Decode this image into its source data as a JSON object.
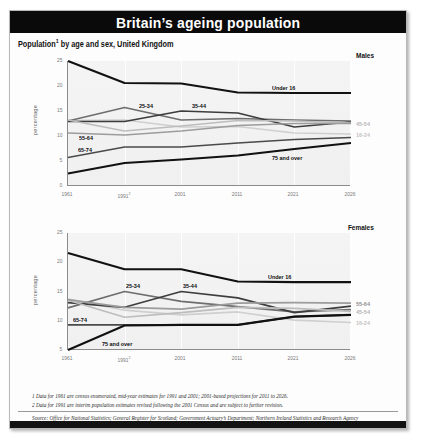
{
  "banner": {
    "title": "Britain’s ageing population"
  },
  "subtitle": {
    "text": "Population",
    "sup": "1",
    "rest": " by age and sex, United Kingdom"
  },
  "footnotes": [
    "1  Data for 1961 are census enumerated, mid-year estimates for 1991 and 2001; 2001-based projections for 2011 to 2026.",
    "2  Data for 1991 are interim population estimates revised following the 2001 Census and are subject to further revision."
  ],
  "source": "Source: Office for National Statistics; General Register for Scotland; Government Actuary’s Department; Northern Ireland Statistics and Research Agency",
  "colors": {
    "under16": "#111111",
    "over75": "#111111",
    "a65_74": "#4a4a4a",
    "a25_34": "#6e6e6e",
    "a35_44": "#3d3d3d",
    "a55_64": "#9c9c9c",
    "a45_54": "#bdbdbd",
    "a16_24": "#cfcfcf",
    "banner_bg": "#0a0a0a",
    "plot_bg": "#f2f2f2",
    "axis": "#8c8c8c"
  },
  "chart_data": [
    {
      "type": "line",
      "title": "Males",
      "xlabel": "",
      "ylabel": "percentage",
      "x": [
        "1961",
        "1991",
        "2001",
        "2011",
        "2021",
        "2026"
      ],
      "x_superscripts": [
        "",
        "2",
        "",
        "",
        "",
        ""
      ],
      "xlim": [
        1961,
        2026
      ],
      "ylim": [
        0,
        25
      ],
      "yticks": [
        0,
        5,
        10,
        15,
        20,
        25
      ],
      "grid": true,
      "legend": "inline-labels",
      "series": [
        {
          "name": "Under 16",
          "label": "Under 16",
          "label_pos": "inline",
          "color": "#111111",
          "width": 2.1,
          "values": [
            25.0,
            20.6,
            20.5,
            18.7,
            18.6,
            18.6
          ]
        },
        {
          "name": "16-24",
          "label": "16-24",
          "label_pos": "right",
          "color": "#cfcfcf",
          "width": 1.7,
          "values": [
            13.1,
            13.2,
            11.8,
            11.9,
            10.6,
            10.4
          ]
        },
        {
          "name": "25-34",
          "label": "25-34",
          "label_pos": "inline",
          "color": "#6e6e6e",
          "width": 1.7,
          "values": [
            13.0,
            15.7,
            13.2,
            13.5,
            13.2,
            13.0
          ]
        },
        {
          "name": "35-44",
          "label": "35-44",
          "label_pos": "inline",
          "color": "#3d3d3d",
          "width": 1.7,
          "values": [
            12.9,
            12.9,
            15.0,
            14.6,
            11.8,
            12.8
          ]
        },
        {
          "name": "45-54",
          "label": "45-54",
          "label_pos": "right",
          "color": "#bdbdbd",
          "width": 1.7,
          "values": [
            13.2,
            11.0,
            12.0,
            13.1,
            13.0,
            12.6
          ]
        },
        {
          "name": "55-64",
          "label": "55-64",
          "label_pos": "inline",
          "color": "#9c9c9c",
          "width": 1.7,
          "values": [
            10.6,
            10.2,
            11.0,
            12.1,
            12.5,
            12.5
          ]
        },
        {
          "name": "65-74",
          "label": "65-74",
          "label_pos": "inline",
          "color": "#4a4a4a",
          "width": 1.7,
          "values": [
            5.7,
            7.8,
            7.8,
            8.6,
            9.3,
            9.7
          ]
        },
        {
          "name": "75 and over",
          "label": "75 and over",
          "label_pos": "inline",
          "color": "#111111",
          "width": 2.1,
          "values": [
            2.5,
            4.6,
            5.3,
            6.1,
            7.4,
            8.6
          ]
        }
      ]
    },
    {
      "type": "line",
      "title": "Females",
      "xlabel": "",
      "ylabel": "percentage",
      "x": [
        "1961",
        "1991",
        "2001",
        "2011",
        "2021",
        "2026"
      ],
      "x_superscripts": [
        "",
        "2",
        "",
        "",
        "",
        ""
      ],
      "xlim": [
        1961,
        2026
      ],
      "ylim": [
        5,
        25
      ],
      "yticks": [
        5,
        10,
        15,
        20,
        25
      ],
      "grid": true,
      "legend": "inline-labels",
      "series": [
        {
          "name": "Under 16",
          "label": "Under 16",
          "label_pos": "inline",
          "color": "#111111",
          "width": 2.1,
          "values": [
            21.6,
            18.8,
            18.8,
            16.7,
            16.6,
            16.6
          ]
        },
        {
          "name": "16-24",
          "label": "16-24",
          "label_pos": "right",
          "color": "#cfcfcf",
          "width": 1.7,
          "values": [
            13.7,
            11.8,
            11.0,
            11.5,
            10.1,
            9.7
          ]
        },
        {
          "name": "25-34",
          "label": "25-34",
          "label_pos": "inline",
          "color": "#6e6e6e",
          "width": 1.7,
          "values": [
            12.2,
            15.0,
            13.3,
            12.4,
            11.5,
            11.9
          ]
        },
        {
          "name": "35-44",
          "label": "35-44",
          "label_pos": "inline",
          "color": "#3d3d3d",
          "width": 1.7,
          "values": [
            13.1,
            12.3,
            15.0,
            13.9,
            11.4,
            12.5
          ]
        },
        {
          "name": "45-54",
          "label": "45-54",
          "label_pos": "right",
          "color": "#bdbdbd",
          "width": 1.7,
          "values": [
            13.5,
            10.6,
            11.4,
            12.3,
            12.1,
            11.6
          ]
        },
        {
          "name": "55-64",
          "label": "55-64",
          "label_pos": "right",
          "color": "#9c9c9c",
          "width": 1.7,
          "values": [
            13.6,
            12.3,
            12.0,
            13.0,
            13.1,
            13.0
          ]
        },
        {
          "name": "65-74",
          "label": "65-74",
          "label_pos": "inline",
          "color": "#4a4a4a",
          "width": 1.7,
          "values": [
            9.3,
            9.3,
            9.3,
            9.3,
            10.7,
            11.0
          ]
        },
        {
          "name": "75 and over",
          "label": "75 and over",
          "label_pos": "inline",
          "color": "#111111",
          "width": 2.1,
          "values": [
            5.0,
            9.2,
            9.3,
            9.3,
            10.7,
            11.0
          ]
        }
      ]
    }
  ]
}
